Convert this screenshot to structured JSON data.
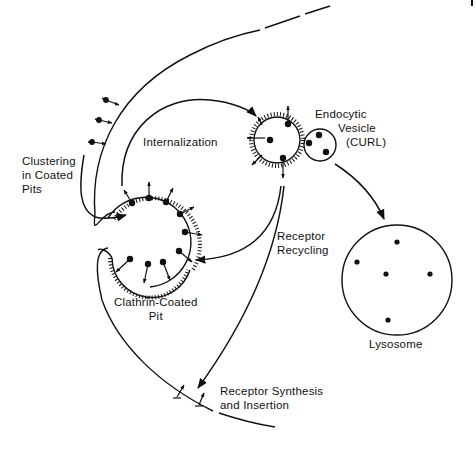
{
  "diagram": {
    "type": "receptor-mediated endocytosis pathway",
    "ink_color": "#111111",
    "background": "#ffffff",
    "labels": {
      "clustering": [
        "Clustering",
        "in Coated",
        "Pits"
      ],
      "internalization": "Internalization",
      "endocytic_vesicle": [
        "Endocytic",
        "Vesicle",
        "(CURL)"
      ],
      "receptor_recycling": [
        "Receptor",
        "Recycling"
      ],
      "clathrin_pit": [
        "Clathrin-Coated",
        "Pit"
      ],
      "lysosome": "Lysosome",
      "receptor_synthesis": [
        "Receptor Synthesis",
        "and Insertion"
      ]
    },
    "nodes": [
      {
        "id": "plasma-membrane",
        "label": "plasma membrane"
      },
      {
        "id": "coated-pit",
        "label": "Clathrin-Coated Pit"
      },
      {
        "id": "curl",
        "label": "Endocytic Vesicle (CURL)"
      },
      {
        "id": "lysosome",
        "label": "Lysosome",
        "dots": 5
      }
    ],
    "edges": [
      {
        "from": "plasma-membrane",
        "to": "coated-pit",
        "label": "Clustering in Coated Pits"
      },
      {
        "from": "coated-pit",
        "to": "curl",
        "label": "Internalization"
      },
      {
        "from": "curl",
        "to": "coated-pit",
        "label": "Receptor Recycling"
      },
      {
        "from": "curl",
        "to": "plasma-membrane",
        "label": "Receptor Synthesis and Insertion"
      },
      {
        "from": "curl",
        "to": "lysosome",
        "label": ""
      }
    ]
  }
}
